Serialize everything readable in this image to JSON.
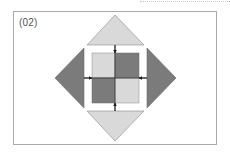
{
  "figure": {
    "label": "(02)",
    "colors": {
      "light": "#d9d9d9",
      "dark": "#7b7b7b",
      "stroke": "#8a8a8a",
      "arrow": "#1a1a1a",
      "frame": "#a9a9a9"
    },
    "triangles": [
      {
        "position": "top",
        "shade": "light"
      },
      {
        "position": "right",
        "shade": "dark"
      },
      {
        "position": "bottom",
        "shade": "light"
      },
      {
        "position": "left",
        "shade": "dark"
      }
    ],
    "center_square": {
      "cells": [
        {
          "position": "top-left",
          "shade": "light"
        },
        {
          "position": "top-right",
          "shade": "dark"
        },
        {
          "position": "bottom-left",
          "shade": "dark"
        },
        {
          "position": "bottom-right",
          "shade": "light"
        }
      ]
    },
    "arrows": [
      {
        "from": "top",
        "direction": "down"
      },
      {
        "from": "right",
        "direction": "left"
      },
      {
        "from": "bottom",
        "direction": "up"
      },
      {
        "from": "left",
        "direction": "right"
      }
    ]
  }
}
